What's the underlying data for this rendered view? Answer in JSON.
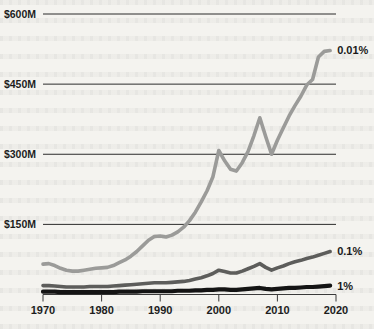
{
  "chart_data": {
    "type": "line",
    "title": "",
    "subtitle": "",
    "xlabel": "",
    "ylabel": "",
    "xlim": [
      1970,
      2020
    ],
    "ylim": [
      0,
      600
    ],
    "grid": true,
    "legend_position": "right-inline-end-of-line",
    "y_unit": "millions of dollars",
    "y_tick_labels": [
      "$600M",
      "$450M",
      "$300M",
      "$150M"
    ],
    "y_tick_values": [
      600,
      450,
      300,
      150
    ],
    "x_tick_labels": [
      "1970",
      "1980",
      "1990",
      "2000",
      "2010",
      "2020"
    ],
    "x_tick_values": [
      1970,
      1980,
      1990,
      2000,
      2010,
      2020
    ],
    "series": [
      {
        "name": "0.01%",
        "label": "0.01%",
        "color": "#9b9b99",
        "stroke_width": 3.6,
        "x": [
          1970,
          1971,
          1972,
          1973,
          1974,
          1975,
          1976,
          1977,
          1978,
          1979,
          1980,
          1981,
          1982,
          1983,
          1984,
          1985,
          1986,
          1987,
          1988,
          1989,
          1990,
          1991,
          1992,
          1993,
          1994,
          1995,
          1996,
          1997,
          1998,
          1999,
          2000,
          2001,
          2002,
          2003,
          2004,
          2005,
          2006,
          2007,
          2008,
          2009,
          2010,
          2011,
          2012,
          2013,
          2014,
          2015,
          2016,
          2017,
          2018,
          2019
        ],
        "values": [
          65,
          66,
          62,
          56,
          52,
          50,
          50,
          52,
          54,
          56,
          57,
          58,
          62,
          68,
          74,
          82,
          92,
          104,
          116,
          124,
          125,
          123,
          127,
          134,
          144,
          158,
          176,
          198,
          222,
          252,
          308,
          286,
          268,
          264,
          282,
          306,
          340,
          378,
          338,
          300,
          330,
          356,
          382,
          404,
          424,
          448,
          460,
          508,
          520,
          522
        ]
      },
      {
        "name": "0.1%",
        "label": "0.1%",
        "color": "#5d5d5b",
        "stroke_width": 3.6,
        "x": [
          1970,
          1971,
          1972,
          1973,
          1974,
          1975,
          1976,
          1977,
          1978,
          1979,
          1980,
          1981,
          1982,
          1983,
          1984,
          1985,
          1986,
          1987,
          1988,
          1989,
          1990,
          1991,
          1992,
          1993,
          1994,
          1995,
          1996,
          1997,
          1998,
          1999,
          2000,
          2001,
          2002,
          2003,
          2004,
          2005,
          2006,
          2007,
          2008,
          2009,
          2010,
          2011,
          2012,
          2013,
          2014,
          2015,
          2016,
          2017,
          2018,
          2019
        ],
        "values": [
          19,
          19,
          18,
          17,
          16,
          16,
          16,
          16,
          17,
          17,
          17,
          17,
          18,
          19,
          20,
          21,
          22,
          23,
          24,
          25,
          25,
          25,
          26,
          27,
          28,
          30,
          33,
          36,
          40,
          45,
          52,
          49,
          46,
          46,
          50,
          55,
          60,
          66,
          58,
          52,
          57,
          61,
          66,
          70,
          73,
          77,
          80,
          84,
          88,
          92
        ]
      },
      {
        "name": "1%",
        "label": "1%",
        "color": "#141414",
        "stroke_width": 4.2,
        "x": [
          1970,
          1971,
          1972,
          1973,
          1974,
          1975,
          1976,
          1977,
          1978,
          1979,
          1980,
          1981,
          1982,
          1983,
          1984,
          1985,
          1986,
          1987,
          1988,
          1989,
          1990,
          1991,
          1992,
          1993,
          1994,
          1995,
          1996,
          1997,
          1998,
          1999,
          2000,
          2001,
          2002,
          2003,
          2004,
          2005,
          2006,
          2007,
          2008,
          2009,
          2010,
          2011,
          2012,
          2013,
          2014,
          2015,
          2016,
          2017,
          2018,
          2019
        ],
        "values": [
          6,
          6,
          6,
          5,
          5,
          5,
          5,
          5,
          5,
          5,
          5,
          5,
          5,
          6,
          6,
          6,
          6,
          7,
          7,
          7,
          7,
          7,
          7,
          8,
          8,
          8,
          9,
          9,
          10,
          10,
          11,
          11,
          10,
          10,
          11,
          12,
          13,
          14,
          12,
          11,
          12,
          13,
          14,
          14,
          15,
          16,
          16,
          17,
          18,
          19
        ]
      }
    ]
  }
}
